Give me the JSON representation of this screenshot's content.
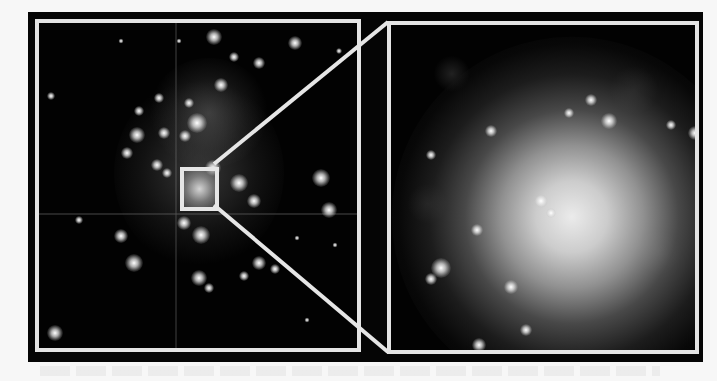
{
  "figure": {
    "left_panel": {
      "label": "wide-field star cluster view",
      "highlight_box": {
        "x": 176,
        "y": 163,
        "width": 39,
        "height": 44
      }
    },
    "right_panel": {
      "label": "magnified view of highlighted region"
    },
    "colors": {
      "background": "#f7f7f7",
      "frame": "#050505",
      "border": "#e4e4e4",
      "connector": "#e6e6e6"
    }
  }
}
